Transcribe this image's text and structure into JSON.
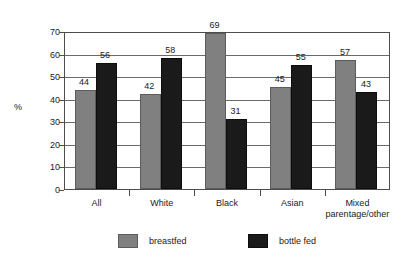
{
  "chart_data": {
    "type": "bar",
    "title": "",
    "subtitle": "",
    "xlabel": "",
    "ylabel": "%",
    "ylim": [
      0,
      70
    ],
    "yticks": [
      0,
      10,
      20,
      30,
      40,
      50,
      60,
      70
    ],
    "ytick_labels": [
      "0",
      "10",
      "20",
      "30",
      "40",
      "50",
      "60",
      "70"
    ],
    "grid": true,
    "legend_position": "bottom",
    "categories": [
      "All",
      "White",
      "Black",
      "Asian",
      "Mixed parentage/other"
    ],
    "category_lines": [
      [
        "All"
      ],
      [
        "White"
      ],
      [
        "Black"
      ],
      [
        "Asian"
      ],
      [
        "Mixed",
        "parentage/other"
      ]
    ],
    "series": [
      {
        "name": "breastfed",
        "color": "#808080",
        "values": [
          44,
          42,
          69,
          45,
          57
        ],
        "labels": [
          "44",
          "42",
          "69",
          "45",
          "57"
        ]
      },
      {
        "name": "bottle fed",
        "color": "#1a1a1a",
        "values": [
          56,
          58,
          31,
          55,
          43
        ],
        "labels": [
          "56",
          "58",
          "31",
          "55",
          "43"
        ]
      }
    ]
  },
  "legend": {
    "items": [
      {
        "label": "breastfed",
        "swatch": "breastfed-swatch"
      },
      {
        "label": "bottle fed",
        "swatch": "bottle-fed-swatch"
      }
    ]
  },
  "axes": {
    "y_title": "%"
  }
}
